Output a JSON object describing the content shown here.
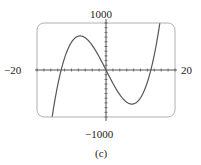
{
  "chart_data": {
    "type": "line",
    "title": "",
    "caption": "(c)",
    "xlabel": "",
    "ylabel": "",
    "xlim": [
      -20,
      20
    ],
    "ylim": [
      -1000,
      1000
    ],
    "grid": false,
    "x_tick_step": 2,
    "y_tick_step": 100,
    "axis_labels": {
      "x_min": "−20",
      "x_max": "20",
      "y_max": "1000",
      "y_min": "−1000"
    },
    "series": [
      {
        "name": "cubic",
        "description": "Cubic with roots near x = -13, 0, 13; local max ~720 near x=-7.5, local min ~-720 near x=7.5",
        "x": [
          -20,
          -18,
          -16,
          -14,
          -13,
          -12,
          -10,
          -7.5,
          -5,
          -2,
          0,
          2,
          5,
          7.5,
          10,
          12,
          13,
          14,
          16,
          18,
          20
        ],
        "y": [
          -1000,
          -773,
          -430,
          -160,
          0,
          150,
          570,
          725,
          620,
          300,
          0,
          -300,
          -620,
          -725,
          -570,
          -150,
          0,
          160,
          430,
          773,
          1000
        ]
      }
    ]
  },
  "labels": {
    "y_top": "1000",
    "y_bottom": "−1000",
    "x_left": "−20",
    "x_right": "20",
    "caption": "(c)"
  },
  "colors": {
    "curve": "#555555",
    "frame": "#aaaaaa",
    "axis": "#555555"
  }
}
